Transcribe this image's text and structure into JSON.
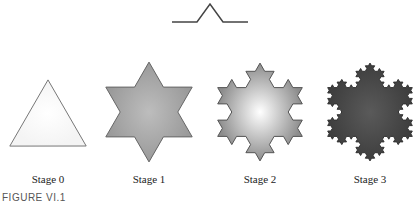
{
  "figure": {
    "caption": "FIGURE VI.1",
    "generator": {
      "name": "koch-generator",
      "description": "line segment with triangular bump"
    },
    "stages": [
      {
        "label": "Stage 0",
        "iterations": 0,
        "fill": "#f4f4f4",
        "center_color": "#ffffff",
        "stroke": "#777777"
      },
      {
        "label": "Stage 1",
        "iterations": 1,
        "fill": "#9a9a9a",
        "center_color": "#bdbdbd",
        "stroke": "#666666"
      },
      {
        "label": "Stage 2",
        "iterations": 2,
        "fill": "#8c8c8c",
        "center_color": "#ffffff",
        "stroke": "#555555"
      },
      {
        "label": "Stage 3",
        "iterations": 3,
        "fill": "#3e3e3e",
        "center_color": "#5a5a5a",
        "stroke": "#333333"
      }
    ]
  }
}
